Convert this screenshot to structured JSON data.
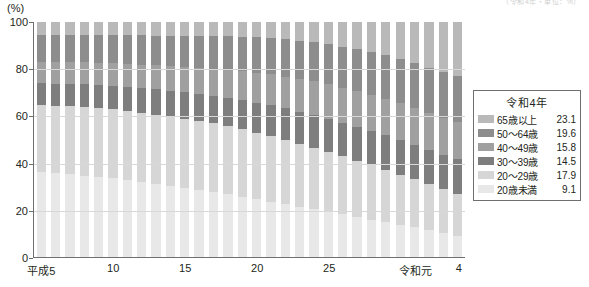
{
  "unit_label": "(%)",
  "top_right_cutoff_text": "（令和4年・単位：%）",
  "legend": {
    "title": "令和4年",
    "rows": [
      {
        "label": "65歳以上",
        "value": "23.1",
        "color": "#b9b9b9"
      },
      {
        "label": "50〜64歳",
        "value": "19.6",
        "color": "#8d8d8d"
      },
      {
        "label": "40〜49歳",
        "value": "15.8",
        "color": "#a0a0a0"
      },
      {
        "label": "30〜39歳",
        "value": "14.5",
        "color": "#7e7e7e"
      },
      {
        "label": "20〜29歳",
        "value": "17.9",
        "color": "#d6d6d6"
      },
      {
        "label": "20歳未満",
        "value": "9.1",
        "color": "#e8e8e8"
      }
    ]
  },
  "chart_data": {
    "type": "bar",
    "subtype": "stacked-100-percent",
    "title": "",
    "xlabel": "",
    "ylabel": "(%)",
    "ylim": [
      0,
      100
    ],
    "yticks": [
      0,
      20,
      40,
      60,
      80,
      100
    ],
    "grid": true,
    "legend_position": "right",
    "categories": [
      "平成5",
      "平成6",
      "平成7",
      "平成8",
      "平成9",
      "平成10",
      "平成11",
      "平成12",
      "平成13",
      "平成14",
      "平成15",
      "平成16",
      "平成17",
      "平成18",
      "平成19",
      "平成20",
      "平成21",
      "平成22",
      "平成23",
      "平成24",
      "平成25",
      "平成26",
      "平成27",
      "平成28",
      "平成29",
      "平成30",
      "令和元",
      "令和2",
      "令和3",
      "令和4"
    ],
    "xtick_labels": [
      {
        "text": "平成5",
        "index": 0
      },
      {
        "text": "10",
        "index": 5
      },
      {
        "text": "15",
        "index": 10
      },
      {
        "text": "20",
        "index": 15
      },
      {
        "text": "25",
        "index": 20
      },
      {
        "text": "令和元",
        "index": 26
      },
      {
        "text": "4",
        "index": 29
      }
    ],
    "stack_order_bottom_to_top": [
      "20歳未満",
      "20〜29歳",
      "30〜39歳",
      "40〜49歳",
      "50〜64歳",
      "65歳以上"
    ],
    "series": [
      {
        "name": "20歳未満",
        "color": "#e8e8e8",
        "values": [
          36.0,
          35.6,
          35.2,
          34.6,
          34.0,
          33.4,
          32.6,
          31.8,
          31.0,
          30.2,
          29.4,
          28.5,
          27.6,
          26.6,
          25.6,
          24.6,
          23.6,
          22.5,
          21.4,
          20.3,
          19.2,
          18.1,
          17.0,
          15.9,
          14.8,
          13.7,
          12.6,
          11.4,
          10.2,
          9.1
        ]
      },
      {
        "name": "20〜29歳",
        "color": "#d6d6d6",
        "values": [
          28.6,
          28.7,
          28.9,
          29.1,
          29.3,
          29.4,
          29.5,
          29.6,
          29.6,
          29.6,
          29.5,
          29.4,
          29.2,
          29.0,
          28.7,
          28.3,
          27.9,
          27.4,
          26.8,
          26.2,
          25.5,
          24.7,
          23.9,
          23.1,
          22.2,
          21.3,
          20.4,
          19.5,
          18.7,
          17.9
        ]
      },
      {
        "name": "30〜39歳",
        "color": "#7e7e7e",
        "values": [
          9.4,
          9.5,
          9.6,
          9.8,
          9.9,
          10.1,
          10.3,
          10.5,
          10.8,
          11.0,
          11.3,
          11.6,
          11.9,
          12.2,
          12.5,
          12.8,
          13.1,
          13.4,
          13.7,
          13.9,
          14.1,
          14.3,
          14.5,
          14.6,
          14.7,
          14.7,
          14.7,
          14.6,
          14.6,
          14.5
        ]
      },
      {
        "name": "40〜49歳",
        "color": "#a0a0a0",
        "values": [
          9.0,
          9.1,
          9.2,
          9.3,
          9.4,
          9.6,
          9.8,
          10.0,
          10.2,
          10.5,
          10.8,
          11.1,
          11.5,
          11.9,
          12.3,
          12.7,
          13.1,
          13.5,
          13.9,
          14.3,
          14.6,
          14.9,
          15.2,
          15.4,
          15.6,
          15.7,
          15.8,
          15.8,
          15.8,
          15.8
        ]
      },
      {
        "name": "50〜64歳",
        "color": "#8d8d8d",
        "values": [
          11.4,
          11.5,
          11.6,
          11.7,
          11.9,
          12.0,
          12.2,
          12.4,
          12.6,
          12.9,
          13.2,
          13.5,
          13.9,
          14.3,
          14.7,
          15.1,
          15.5,
          15.9,
          16.3,
          16.7,
          17.1,
          17.5,
          17.9,
          18.2,
          18.5,
          18.8,
          19.1,
          19.3,
          19.5,
          19.6
        ]
      },
      {
        "name": "65歳以上",
        "color": "#b9b9b9",
        "values": [
          5.6,
          5.6,
          5.5,
          5.5,
          5.5,
          5.5,
          5.6,
          5.7,
          5.8,
          5.8,
          5.8,
          5.9,
          5.9,
          6.0,
          6.2,
          6.5,
          6.8,
          7.3,
          7.9,
          8.6,
          9.5,
          10.5,
          11.5,
          12.8,
          14.2,
          15.8,
          17.4,
          19.4,
          21.2,
          23.1
        ]
      }
    ]
  }
}
